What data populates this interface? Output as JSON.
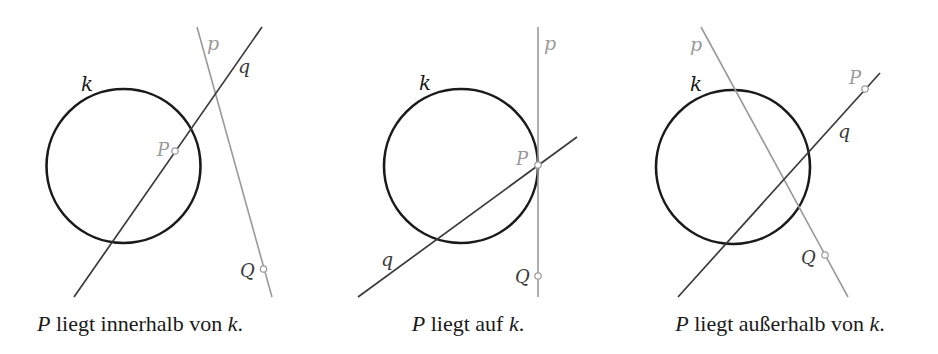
{
  "panels": [
    {
      "id": "inside",
      "caption": {
        "var": "P",
        "text": " liegt innerhalb von ",
        "var2": "k",
        "end": "."
      },
      "labels": {
        "k": "k",
        "p": "p",
        "q": "q",
        "P": "P",
        "Q": "Q"
      }
    },
    {
      "id": "on",
      "caption": {
        "var": "P",
        "text": " liegt auf ",
        "var2": "k",
        "end": "."
      },
      "labels": {
        "k": "k",
        "p": "p",
        "q": "q",
        "P": "P",
        "Q": "Q"
      }
    },
    {
      "id": "outside",
      "caption": {
        "var": "P",
        "text": " liegt außerhalb von ",
        "var2": "k",
        "end": "."
      },
      "labels": {
        "k": "k",
        "p": "p",
        "q": "q",
        "P": "P",
        "Q": "Q"
      }
    }
  ],
  "colors": {
    "circle": "#1a1a1a",
    "line_q": "#3a3a3a",
    "line_p": "#9a9a9a",
    "label_gray": "#9a9a9a",
    "label_dark": "#2a2a2a"
  }
}
